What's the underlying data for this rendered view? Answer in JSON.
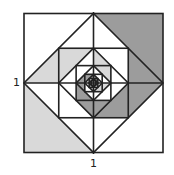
{
  "figure": {
    "outer_square": {
      "x": 24,
      "y": 12,
      "size": 139,
      "side_length_label": "1"
    },
    "levels": 5,
    "colors": {
      "stroke": "#222222",
      "light_fill": "#d9d9d9",
      "dark_fill": "#9c9c9c",
      "background": "#ffffff"
    }
  },
  "labels": {
    "left_side": "1",
    "bottom_side": "1"
  }
}
